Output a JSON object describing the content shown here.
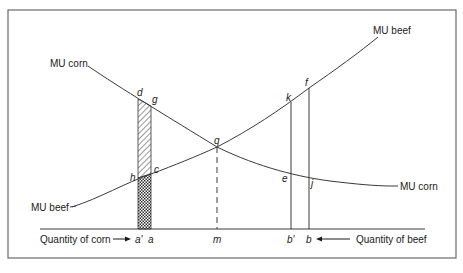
{
  "diagram": {
    "title": "",
    "colors": {
      "line": "#3a3a3a",
      "frame": "#6a6a6a",
      "text": "#1a1a1a",
      "background": "#ffffff"
    },
    "curves": {
      "mu_corn_top": "MU corn",
      "mu_corn_right": "MU corn",
      "mu_beef_top": "MU beef",
      "mu_beef_left": "MU beef"
    },
    "axis": {
      "left_label": "Quantity of corn",
      "right_label": "Quantity of beef"
    },
    "ticks": {
      "a_prime": "a'",
      "a": "a",
      "m": "m",
      "b_prime": "b'",
      "b": "b"
    },
    "points": {
      "d": "d",
      "g": "g",
      "h": "h",
      "c": "c",
      "q": "q",
      "k": "k",
      "f": "f",
      "e": "e",
      "j": "j"
    },
    "regions": {
      "hatched": "area d-g-c-h (hatched)",
      "crosshatched": "area h-c-a-a' (cross-hatched)"
    }
  }
}
